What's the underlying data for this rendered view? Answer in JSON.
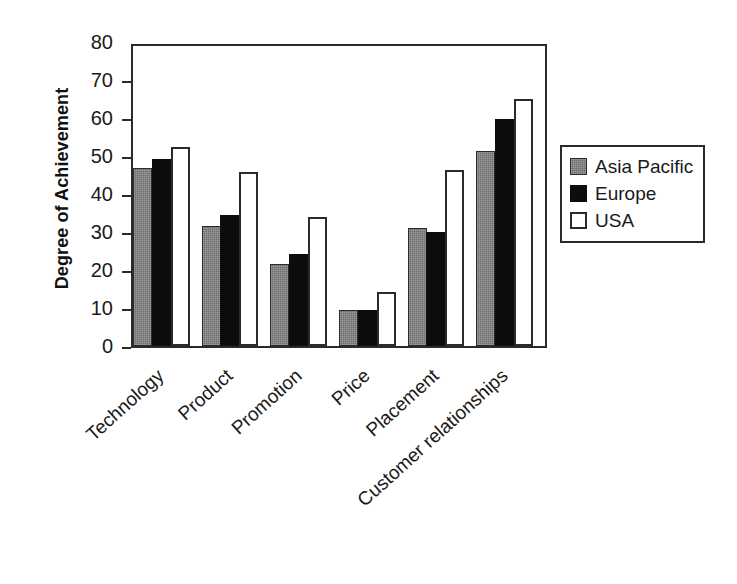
{
  "chart_data": {
    "type": "bar",
    "title": "",
    "subtitle": "",
    "xlabel": "",
    "ylabel": "Degree of Achievement",
    "ylim": [
      0,
      80
    ],
    "yticks": [
      0,
      10,
      20,
      30,
      40,
      50,
      60,
      70,
      80
    ],
    "ytick_labels": [
      "0",
      "10",
      "20",
      "30",
      "40",
      "50",
      "60",
      "70",
      "80"
    ],
    "grid": false,
    "legend_position": "right",
    "categories": [
      "Technology",
      "Product",
      "Promotion",
      "Price",
      "Placement",
      "Customer relationships"
    ],
    "series": [
      {
        "name": "Asia Pacific",
        "color": "#6e6e6e",
        "values": [
          47.5,
          32,
          22,
          9.5,
          31.5,
          52
        ]
      },
      {
        "name": "Europe",
        "color": "#0d0d0d",
        "values": [
          50,
          35,
          24.5,
          9.5,
          30.5,
          60.5
        ]
      },
      {
        "name": "USA",
        "color": "#ffffff",
        "values": [
          53,
          46.5,
          34.5,
          14.5,
          47,
          66
        ]
      }
    ]
  },
  "legend": {
    "entries": [
      {
        "label": "Asia Pacific",
        "swatch": "gray-swatch"
      },
      {
        "label": "Europe",
        "swatch": "black-swatch"
      },
      {
        "label": "USA",
        "swatch": "white-swatch"
      }
    ]
  },
  "axes": {
    "y_title": "Degree of Achievement",
    "axis_color": "#2b2b2b"
  }
}
